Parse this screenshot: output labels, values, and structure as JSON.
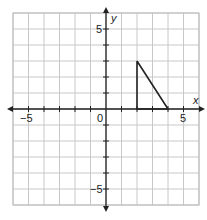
{
  "chart_data": {
    "type": "line",
    "title": "",
    "xlabel": "x",
    "ylabel": "y",
    "xlim": [
      -6,
      6
    ],
    "ylim": [
      -6,
      6
    ],
    "grid": true,
    "x_tick_labels": [
      "-5",
      "0",
      "5"
    ],
    "y_tick_labels": [
      "5",
      "-5"
    ],
    "series": [
      {
        "name": "triangle",
        "points": [
          [
            2,
            3
          ],
          [
            2,
            0
          ],
          [
            4,
            0
          ],
          [
            2,
            3
          ]
        ]
      }
    ]
  },
  "labels": {
    "x_axis": "x",
    "y_axis": "y",
    "origin": "0",
    "x_neg5": "−5",
    "x_pos5": "5",
    "y_pos5": "5",
    "y_neg5": "−5"
  }
}
